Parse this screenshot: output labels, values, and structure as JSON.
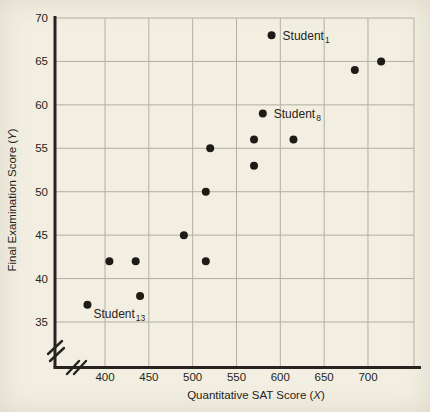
{
  "figure": {
    "background": "#f2efe2",
    "grid_color": "#b2afa2",
    "axis_color": "#262320",
    "dot_color": "#1e1b17",
    "text_color": "#262320"
  },
  "chart_data": {
    "type": "scatter",
    "title": "",
    "xlabel": "Quantitative SAT Score (X)",
    "ylabel": "Final Examination Score (Y)",
    "x_ticks": [
      400,
      450,
      500,
      550,
      600,
      650,
      700
    ],
    "y_ticks": [
      35,
      40,
      45,
      50,
      55,
      60,
      65,
      70
    ],
    "xlim": [
      365,
      755
    ],
    "ylim": [
      35,
      70
    ],
    "grid": true,
    "axis_break_x": true,
    "axis_break_y": true,
    "legend": "none",
    "points": [
      {
        "x": 590,
        "y": 68,
        "label": "Student",
        "sub": "1",
        "label_side": "right"
      },
      {
        "x": 685,
        "y": 64
      },
      {
        "x": 715,
        "y": 65
      },
      {
        "x": 580,
        "y": 59,
        "label": "Student",
        "sub": "8",
        "label_side": "right"
      },
      {
        "x": 570,
        "y": 56
      },
      {
        "x": 615,
        "y": 56
      },
      {
        "x": 570,
        "y": 53
      },
      {
        "x": 520,
        "y": 55
      },
      {
        "x": 515,
        "y": 50
      },
      {
        "x": 490,
        "y": 45
      },
      {
        "x": 405,
        "y": 42
      },
      {
        "x": 435,
        "y": 42
      },
      {
        "x": 515,
        "y": 42
      },
      {
        "x": 440,
        "y": 38
      },
      {
        "x": 380,
        "y": 37,
        "label": "Student",
        "sub": "13",
        "label_side": "below-right"
      }
    ]
  }
}
